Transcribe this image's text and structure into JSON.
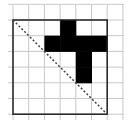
{
  "diagram": {
    "grid": {
      "cols": 6,
      "rows": 6,
      "cell_size": 15.7,
      "origin": [
        13,
        20
      ],
      "color": "#c8c8c8"
    },
    "border_color": "#222222",
    "filled_cells": [
      [
        3,
        0
      ],
      [
        2,
        1
      ],
      [
        3,
        1
      ],
      [
        4,
        1
      ],
      [
        5,
        1
      ],
      [
        4,
        2
      ],
      [
        4,
        3
      ]
    ],
    "fill_color": "#000000",
    "diagonal": {
      "from": [
        0,
        0
      ],
      "to": [
        6,
        6
      ],
      "style": "dashed"
    }
  }
}
